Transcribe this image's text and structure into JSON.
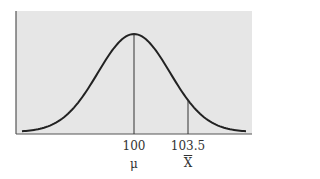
{
  "chart_data": {
    "type": "line",
    "title": "",
    "xlabel": "",
    "ylabel": "",
    "distribution": "normal",
    "mean": 100,
    "marked_values": [
      100,
      103.5
    ],
    "tick_labels": [
      "100",
      "103.5"
    ],
    "symbol_labels": [
      "μ",
      "X̄"
    ],
    "annotations": [
      {
        "x": 100,
        "label": "100",
        "symbol": "μ",
        "line": "vertical from baseline to curve peak"
      },
      {
        "x": 103.5,
        "label": "103.5",
        "symbol": "X̄",
        "line": "vertical from baseline to curve"
      }
    ],
    "grid": false,
    "background": "#e6e6e6",
    "line_color": "#222222"
  },
  "labels": {
    "mean_value": "100",
    "sample_value": "103.5",
    "mean_symbol": "μ",
    "sample_symbol": "X"
  }
}
